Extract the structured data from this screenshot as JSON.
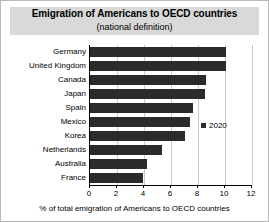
{
  "chart_data": {
    "type": "bar",
    "orientation": "horizontal",
    "title": "Emigration of Americans to OECD countries",
    "subtitle": "(national definition)",
    "xlabel": "% of total emigration of Americans to OECD countries",
    "ylabel": "",
    "xlim": [
      0,
      12
    ],
    "xticks": [
      0,
      2,
      4,
      6,
      8,
      10,
      12
    ],
    "grid": true,
    "legend_position": "inside-right",
    "categories": [
      "Germany",
      "United Kingdom",
      "Canada",
      "Japan",
      "Spain",
      "Mexico",
      "Korea",
      "Netherlands",
      "Australia",
      "France"
    ],
    "series": [
      {
        "name": "2020",
        "color": "#2b2b2b",
        "values": [
          10.1,
          10.1,
          8.6,
          8.5,
          7.6,
          7.4,
          7.0,
          5.3,
          4.2,
          3.9
        ]
      }
    ]
  },
  "legend": {
    "entries": [
      {
        "label": "2020",
        "color": "#2b2b2b"
      }
    ]
  }
}
